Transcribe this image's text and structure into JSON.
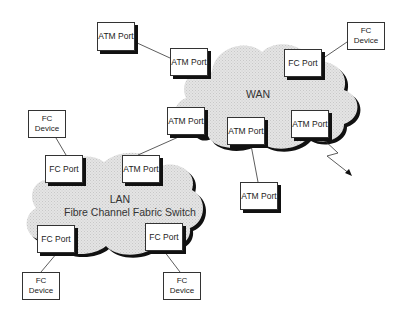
{
  "diagram": {
    "clouds": {
      "wan": {
        "label": "WAN"
      },
      "lan": {
        "label_line1": "LAN",
        "label_line2": "Fibre Channel Fabric Switch"
      }
    },
    "nodes": {
      "atm_standalone_top": "ATM Port",
      "wan_atm_top_left": "ATM Port",
      "wan_fc_port_top_right": "FC Port",
      "fc_device_top_right": "FC Device",
      "wan_atm_left_mid": "ATM Port",
      "wan_atm_bottom_center": "ATM Port",
      "wan_atm_bottom_right": "ATM Port",
      "atm_standalone_below_wan": "ATM Port",
      "fc_device_lan_upper_left": "FC Device",
      "lan_fc_port_top_left": "FC Port",
      "lan_atm_port_top_right": "ATM Port",
      "lan_fc_port_bottom_left": "FC Port",
      "lan_fc_port_bottom_right": "FC Port",
      "fc_device_bottom_left": "FC Device",
      "fc_device_bottom_right": "FC Device"
    },
    "connections": [
      [
        "atm_standalone_top",
        "wan_atm_top_left"
      ],
      [
        "wan_fc_port_top_right",
        "fc_device_top_right"
      ],
      [
        "wan_atm_left_mid",
        "lan_atm_port_top_right"
      ],
      [
        "wan_atm_bottom_center",
        "atm_standalone_below_wan"
      ],
      [
        "wan_atm_bottom_right",
        "lightning-arrow-out"
      ],
      [
        "fc_device_lan_upper_left",
        "lan_fc_port_top_left"
      ],
      [
        "lan_fc_port_bottom_left",
        "fc_device_bottom_left"
      ],
      [
        "lan_fc_port_bottom_right",
        "fc_device_bottom_right"
      ]
    ]
  }
}
